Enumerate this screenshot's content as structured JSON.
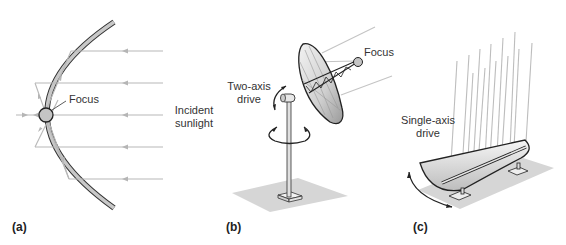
{
  "figure": {
    "panels": [
      {
        "id": "a",
        "label": "(a)",
        "description": "Parabolic reflector cross-section",
        "annotations": {
          "focus": "Focus",
          "incident_line1": "Incident",
          "incident_line2": "sunlight"
        }
      },
      {
        "id": "b",
        "label": "(b)",
        "description": "Parabolic dish on two-axis drive",
        "annotations": {
          "drive_line1": "Two-axis",
          "drive_line2": "drive",
          "focus": "Focus"
        }
      },
      {
        "id": "c",
        "label": "(c)",
        "description": "Parabolic trough on single-axis drive",
        "annotations": {
          "drive_line1": "Single-axis",
          "drive_line2": "drive"
        }
      }
    ],
    "colors": {
      "reflector": "#c8c8c8",
      "ray": "#b0b0b0",
      "outline": "#333333",
      "ground": "#d9d9d9",
      "focus_fill": "#c4c4c4"
    }
  }
}
